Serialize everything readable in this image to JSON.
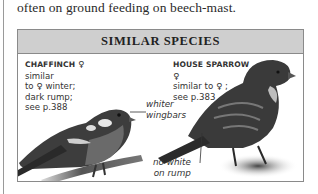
{
  "page": {
    "intro_text": "often on ground feeding on beech-mast."
  },
  "similar_species": {
    "title": "SIMILAR SPECIES",
    "items": [
      {
        "name": "CHAFFINCH",
        "sex_symbol": "♀",
        "description_lines": [
          "similar",
          "to ♀ winter;",
          "dark rump;",
          "see p.388"
        ]
      },
      {
        "name": "HOUSE SPARROW",
        "sex_symbol": "♀",
        "description_lines": [
          "similar to ♀ ;",
          "see p.383"
        ]
      }
    ],
    "annotations": {
      "wingbars": [
        "whiter",
        "wingbars"
      ],
      "rump": [
        "no white",
        "on rump"
      ]
    }
  },
  "colors": {
    "header_bg": "#cfcfcf",
    "border": "#8a8a8a"
  }
}
